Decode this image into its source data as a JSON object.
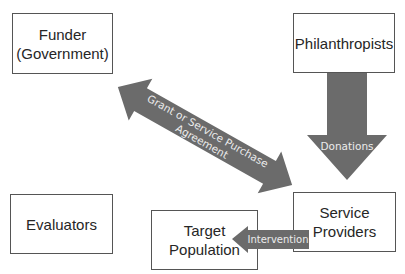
{
  "diagram": {
    "nodes": [
      {
        "id": "funder",
        "label_line1": "Funder",
        "label_line2": "(Government)"
      },
      {
        "id": "philanthropists",
        "label": "Philanthropists"
      },
      {
        "id": "evaluators",
        "label": "Evaluators"
      },
      {
        "id": "target_population",
        "label_line1": "Target",
        "label_line2": "Population"
      },
      {
        "id": "service_providers",
        "label_line1": "Service",
        "label_line2": "Providers"
      }
    ],
    "edges": [
      {
        "id": "agreement",
        "from": "funder",
        "to": "service_providers",
        "bidirectional": true,
        "label_line1": "Grant or Service Purchase",
        "label_line2": "Agreement"
      },
      {
        "id": "donations",
        "from": "philanthropists",
        "to": "service_providers",
        "label": "Donations"
      },
      {
        "id": "intervention",
        "from": "service_providers",
        "to": "target_population",
        "label": "Intervention"
      }
    ],
    "colors": {
      "arrow_fill": "#6b6b6b",
      "box_border": "#555555",
      "text": "#262626",
      "arrow_text": "#ececec"
    }
  }
}
